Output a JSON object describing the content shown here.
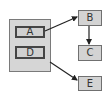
{
  "diagram": {
    "type": "flow-diagram",
    "container": {
      "label": "",
      "children": [
        "A",
        "D"
      ]
    },
    "nodes": {
      "a": {
        "label": "A"
      },
      "d": {
        "label": "D"
      },
      "b": {
        "label": "B"
      },
      "c": {
        "label": "C"
      },
      "e": {
        "label": "E"
      }
    },
    "edges": [
      {
        "from": "A",
        "to": "B"
      },
      {
        "from": "B",
        "to": "C"
      },
      {
        "from": "D",
        "to": "E"
      }
    ],
    "colors": {
      "node_fill": "#d3d3d3",
      "container_fill": "#d6d6d6",
      "inner_border": "#454545",
      "outer_border": "#707070",
      "edge": "#222222"
    }
  }
}
